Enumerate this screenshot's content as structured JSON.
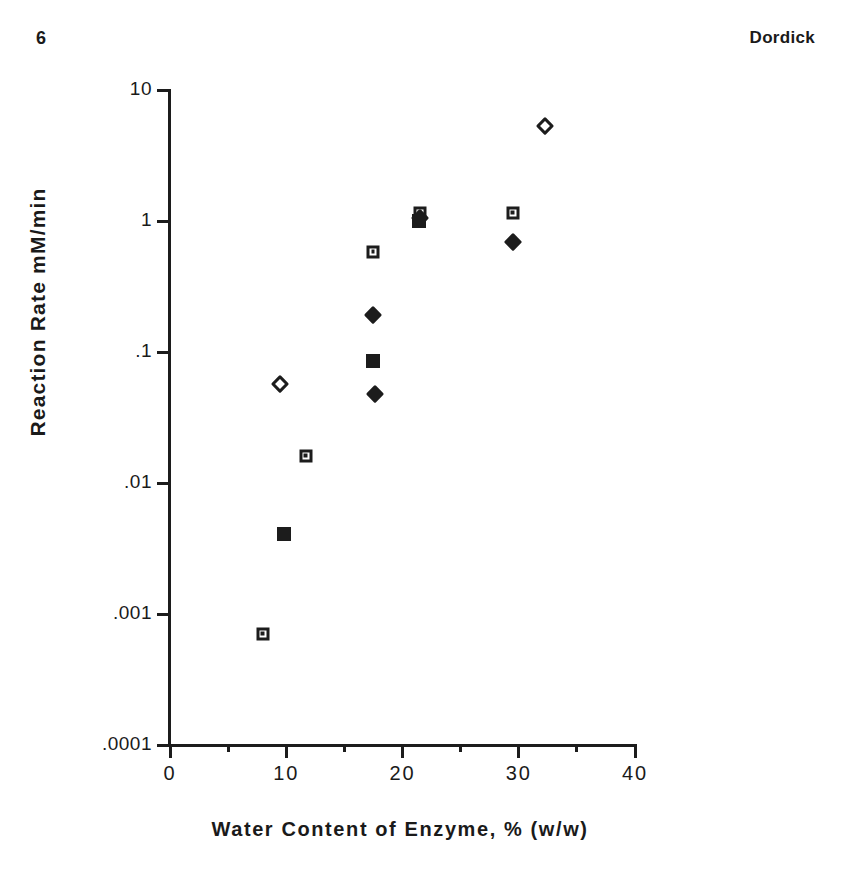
{
  "page": {
    "number": "6",
    "running_head": "Dordick"
  },
  "chart_data": {
    "type": "scatter",
    "title": "",
    "xlabel": "Water Content of Enzyme, %  (w/w)",
    "ylabel": "Reaction Rate  mM/min",
    "yscale": "log",
    "xscale": "linear",
    "xlim": [
      0,
      40
    ],
    "ylim": [
      0.0001,
      10
    ],
    "grid": false,
    "legend": "none",
    "x_ticks": [
      {
        "value": 0,
        "label": "0",
        "major": true
      },
      {
        "value": 5,
        "label": "",
        "major": false
      },
      {
        "value": 10,
        "label": "10",
        "major": true
      },
      {
        "value": 15,
        "label": "",
        "major": false
      },
      {
        "value": 20,
        "label": "20",
        "major": true
      },
      {
        "value": 25,
        "label": "",
        "major": false
      },
      {
        "value": 30,
        "label": "30",
        "major": true
      },
      {
        "value": 35,
        "label": "",
        "major": false
      },
      {
        "value": 40,
        "label": "40",
        "major": true
      }
    ],
    "y_ticks": [
      {
        "value": 10,
        "label": "10"
      },
      {
        "value": 1,
        "label": "1"
      },
      {
        "value": 0.1,
        "label": ".1"
      },
      {
        "value": 0.01,
        "label": ".01"
      },
      {
        "value": 0.001,
        "label": ".001"
      },
      {
        "value": 0.0001,
        "label": ".0001"
      }
    ],
    "series": [
      {
        "name": "open-square",
        "marker": "open-square",
        "points": [
          {
            "x": 8.0,
            "y": 0.0007
          },
          {
            "x": 11.7,
            "y": 0.016
          },
          {
            "x": 17.5,
            "y": 0.58
          },
          {
            "x": 21.5,
            "y": 1.15
          },
          {
            "x": 29.5,
            "y": 1.15
          }
        ]
      },
      {
        "name": "filled-square",
        "marker": "filled-square",
        "points": [
          {
            "x": 9.8,
            "y": 0.0041
          },
          {
            "x": 17.5,
            "y": 0.086
          },
          {
            "x": 21.4,
            "y": 1.0
          }
        ]
      },
      {
        "name": "open-diamond",
        "marker": "open-diamond",
        "points": [
          {
            "x": 9.5,
            "y": 0.057
          },
          {
            "x": 32.3,
            "y": 5.3
          }
        ]
      },
      {
        "name": "filled-diamond",
        "marker": "filled-diamond",
        "points": [
          {
            "x": 17.5,
            "y": 0.19
          },
          {
            "x": 17.6,
            "y": 0.048
          },
          {
            "x": 21.5,
            "y": 1.05
          },
          {
            "x": 29.5,
            "y": 0.69
          }
        ]
      }
    ]
  }
}
